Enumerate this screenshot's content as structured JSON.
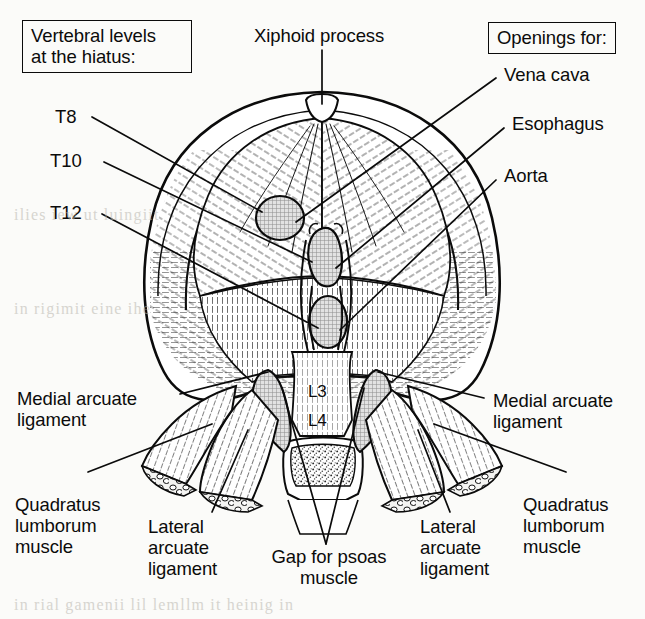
{
  "figure": {
    "background_color": "#fbfbf9",
    "ink_color": "#0b0b0b",
    "opening_fill": "#c9c9c9",
    "crus_fill": "#cccccc"
  },
  "boxes": {
    "vertebral_levels": "Vertebral levels\nat the hiatus:",
    "openings_for": "Openings for:"
  },
  "vertebral_labels": [
    {
      "id": "t8",
      "text": "T8"
    },
    {
      "id": "t10",
      "text": "T10"
    },
    {
      "id": "t12",
      "text": "T12"
    }
  ],
  "openings": [
    {
      "id": "vena-cava",
      "text": "Vena cava",
      "vertebral_level": "T8"
    },
    {
      "id": "esophagus",
      "text": "Esophagus",
      "vertebral_level": "T10"
    },
    {
      "id": "aorta",
      "text": "Aorta",
      "vertebral_level": "T12"
    }
  ],
  "labels": {
    "xiphoid_process": "Xiphoid process",
    "medial_arcuate_ligament_left": "Medial arcuate\nligament",
    "medial_arcuate_ligament_right": "Medial arcuate\nligament",
    "lateral_arcuate_ligament_left": "Lateral\narcuate\nligament",
    "lateral_arcuate_ligament_right": "Lateral\narcuate\nligament",
    "quadratus_lumborum_left": "Quadratus\nlumborum\nmuscle",
    "quadratus_lumborum_right": "Quadratus\nlumborum\nmuscle",
    "gap_for_psoas": "Gap for psoas\nmuscle"
  },
  "vertebrae": [
    {
      "id": "l3",
      "text": "L3"
    },
    {
      "id": "l4",
      "text": "L4"
    }
  ],
  "bleed_through": [
    "ilies iew ut luingiit",
    "in rial gamenii lil lemllm it heinig in",
    "in rigimit eine ihe"
  ]
}
